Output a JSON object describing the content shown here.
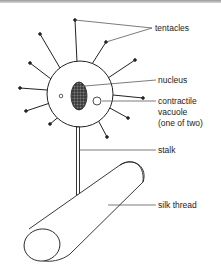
{
  "diagram": {
    "labels": {
      "tentacles": "tentacles",
      "nucleus": "nucleus",
      "vacuole_line1": "contractile",
      "vacuole_line2": "vacuole",
      "vacuole_line3": "(one of two)",
      "stalk": "stalk",
      "silk_thread": "silk thread"
    },
    "colors": {
      "stroke": "#222222",
      "background": "#ffffff",
      "label": "#222222"
    }
  }
}
